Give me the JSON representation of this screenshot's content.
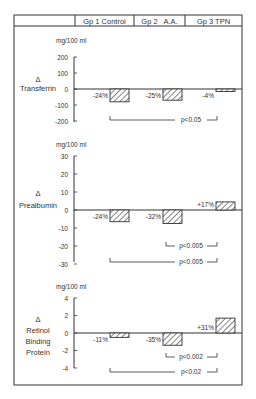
{
  "header": {
    "columns": [
      "",
      "Gp 1 Control",
      "Gp 2   A.A.",
      "Gp 3 TPN"
    ]
  },
  "unit_label": "mg/100 ml",
  "chart_data": [
    {
      "type": "bar",
      "title": "Δ Transferrin",
      "ylabel_lines": [
        "Δ",
        "Transferrin"
      ],
      "unit": "mg/100 ml",
      "categories": [
        "Gp 1 Control",
        "Gp 2 A.A.",
        "Gp 3 TPN"
      ],
      "values": [
        -80,
        -70,
        -12
      ],
      "value_labels": [
        "-24%",
        "-25%",
        "-4%"
      ],
      "yticks": [
        200,
        100,
        0,
        -100,
        -200
      ],
      "ylim": [
        -200,
        200
      ],
      "significance": [
        {
          "from": "Gp 1 Control",
          "to": "Gp 3 TPN",
          "label": "p<0.05"
        }
      ]
    },
    {
      "type": "bar",
      "title": "Δ Prealbumin",
      "ylabel_lines": [
        "Δ",
        "Prealbumin"
      ],
      "unit": "mg/100 ml",
      "categories": [
        "Gp 1 Control",
        "Gp 2 A.A.",
        "Gp 3 TPN"
      ],
      "values": [
        -6.5,
        -7.5,
        4.5
      ],
      "value_labels": [
        "-24%",
        "-32%",
        "+17%"
      ],
      "yticks": [
        30,
        20,
        10,
        0,
        -10,
        -20,
        -30
      ],
      "ylim": [
        -30,
        30
      ],
      "significance": [
        {
          "from": "Gp 2 A.A.",
          "to": "Gp 3 TPN",
          "label": "p<0.005"
        },
        {
          "from": "Gp 1 Control",
          "to": "Gp 3 TPN",
          "label": "p<0.005"
        }
      ]
    },
    {
      "type": "bar",
      "title": "Δ Retinol Binding Protein",
      "ylabel_lines": [
        "Δ",
        "Retinol",
        "Binding",
        "Protein"
      ],
      "unit": "mg/100 ml",
      "categories": [
        "Gp 1 Control",
        "Gp 2 A.A.",
        "Gp 3 TPN"
      ],
      "values": [
        -0.5,
        -1.4,
        1.7
      ],
      "value_labels": [
        "-11%",
        "-35%",
        "+31%"
      ],
      "yticks": [
        4,
        2,
        0,
        -2,
        -4
      ],
      "ylim": [
        -4,
        4
      ],
      "significance": [
        {
          "from": "Gp 2 A.A.",
          "to": "Gp 3 TPN",
          "label": "p<0.002"
        },
        {
          "from": "Gp 1 Control",
          "to": "Gp 3 TPN",
          "label": "p<0.02"
        }
      ]
    }
  ]
}
